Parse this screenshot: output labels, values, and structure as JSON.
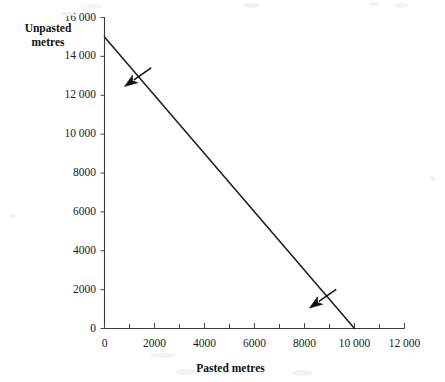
{
  "figure": {
    "background_color": "#ffffff",
    "line_color": "#222222",
    "axis_color": "#3a3a3a",
    "text_color": "#1a1a1a"
  },
  "axes": {
    "y_title": "Unpasted\nmetres",
    "x_title": "Pasted metres",
    "y_tick_labels": [
      "16 000",
      "14 000",
      "12 000",
      "10 000",
      "8000",
      "6000",
      "4000",
      "2000",
      "0"
    ],
    "x_tick_labels": [
      "0",
      "2000",
      "4000",
      "6000",
      "8000",
      "10 000",
      "12 000"
    ]
  },
  "chart_data": {
    "type": "line",
    "title": "",
    "subtitle": "",
    "xlabel": "Pasted metres",
    "ylabel": "Unpasted metres",
    "xlim": [
      0,
      12000
    ],
    "ylim": [
      0,
      16000
    ],
    "xticks": [
      0,
      2000,
      4000,
      6000,
      8000,
      10000,
      12000
    ],
    "xticks_minor_step": 1000,
    "yticks": [
      0,
      2000,
      4000,
      6000,
      8000,
      10000,
      12000,
      14000,
      16000
    ],
    "grid": false,
    "legend": false,
    "legend_position": "none",
    "series": [
      {
        "name": "Production possibility frontier",
        "x": [
          0,
          10000
        ],
        "y": [
          15000,
          0
        ],
        "x_intercept": 10000,
        "y_intercept": 15000,
        "slope": -1.5
      }
    ],
    "annotations": [
      {
        "name": "upper-arrow",
        "kind": "arrow",
        "points_toward": "down-left",
        "tip_x": 800,
        "tip_y": 12450,
        "tail_x": 1850,
        "tail_y": 13400
      },
      {
        "name": "lower-arrow",
        "kind": "arrow",
        "points_toward": "down-left",
        "tip_x": 8200,
        "tip_y": 1050,
        "tail_x": 9250,
        "tail_y": 2000
      }
    ]
  }
}
